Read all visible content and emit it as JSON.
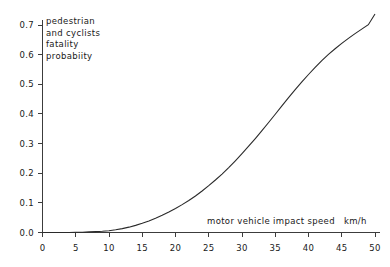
{
  "chart_data": {
    "type": "line",
    "title": "",
    "subtitle": "",
    "xlabel": "motor vehicle impact speed",
    "xunits": "km/h",
    "ylabel_lines": [
      "pedestrian",
      "and cyclists",
      "fatality",
      "probabiity"
    ],
    "ylabel": "pedestrian and cyclists fatality probabiity",
    "xlim": [
      0,
      50
    ],
    "ylim": [
      0.0,
      0.74
    ],
    "xticks": [
      0,
      5,
      10,
      15,
      20,
      25,
      30,
      35,
      40,
      45,
      50
    ],
    "xtick_labels": [
      "0",
      "5",
      "10",
      "15",
      "20",
      "25",
      "30",
      "35",
      "40",
      "45",
      "50"
    ],
    "yticks": [
      0.0,
      0.1,
      0.2,
      0.3,
      0.4,
      0.5,
      0.6,
      0.7
    ],
    "ytick_labels": [
      "0.0",
      "0.1",
      "0.2",
      "0.3",
      "0.4",
      "0.5",
      "0.6",
      "0.7"
    ],
    "grid": false,
    "legend": null,
    "legend_position": "none",
    "series": [
      {
        "name": "fatality probability",
        "color": "#2a2a2a",
        "x": [
          0,
          1,
          2,
          3,
          4,
          5,
          6,
          7,
          8,
          9,
          10,
          11,
          12,
          13,
          14,
          15,
          16,
          17,
          18,
          19,
          20,
          21,
          22,
          23,
          24,
          25,
          26,
          27,
          28,
          29,
          30,
          31,
          32,
          33,
          34,
          35,
          36,
          37,
          38,
          39,
          40,
          41,
          42,
          43,
          44,
          45,
          46,
          47,
          48,
          49,
          50
        ],
        "y": [
          0.0,
          0.0,
          0.0,
          0.0,
          0.0,
          0.001,
          0.001,
          0.002,
          0.003,
          0.004,
          0.006,
          0.009,
          0.013,
          0.018,
          0.024,
          0.031,
          0.039,
          0.048,
          0.058,
          0.069,
          0.081,
          0.094,
          0.108,
          0.123,
          0.14,
          0.158,
          0.177,
          0.197,
          0.219,
          0.242,
          0.266,
          0.291,
          0.317,
          0.344,
          0.371,
          0.399,
          0.427,
          0.455,
          0.482,
          0.508,
          0.533,
          0.557,
          0.58,
          0.601,
          0.62,
          0.638,
          0.655,
          0.671,
          0.686,
          0.701,
          0.737
        ]
      }
    ],
    "annotations": []
  },
  "axes": {
    "y_axis_name": "fatality-probability-axis",
    "x_axis_name": "impact-speed-axis"
  }
}
